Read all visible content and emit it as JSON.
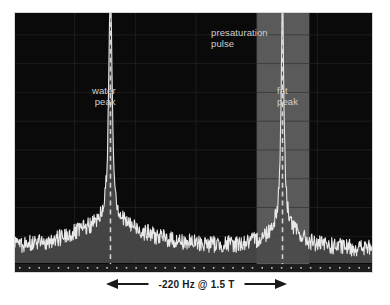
{
  "figure": {
    "background_color": "#ffffff",
    "plot_background_color": "#0a0a0a",
    "trace_color": "#e8e8e8",
    "fill_color": "#4a4a4a",
    "grid_color": "#2b2b2b",
    "band_color": "#5a5a5a",
    "marker_color": "#dcdcdc"
  },
  "annotations": {
    "presaturation_label": "presaturation\npulse",
    "water_label": "water\npeak",
    "fat_label": "fat\npeak",
    "axis_label": "-220 Hz @ 1.5 T"
  },
  "chart_data": {
    "type": "line",
    "title": "",
    "xlabel": "-220 Hz @ 1.5 T",
    "ylabel": "",
    "grid": true,
    "legend": null,
    "xlim": [
      0,
      359
    ],
    "ylim": [
      0,
      1
    ],
    "x_grid_positions": [
      60,
      121,
      182,
      243,
      304
    ],
    "y_grid_positions": [
      22,
      51,
      80,
      109,
      138,
      167,
      196,
      225
    ],
    "axis_ticks_count": 37,
    "peaks": [
      {
        "name": "water peak",
        "x": 96,
        "height": 1.0,
        "width": 2.0,
        "base_width": 44,
        "marker": "dashed-vertical-line",
        "label": "water\npeak"
      },
      {
        "name": "fat peak",
        "x": 269,
        "height": 0.93,
        "width": 1.6,
        "base_width": 16,
        "marker": "dashed-vertical-line",
        "label": "fat\npeak"
      }
    ],
    "bands": [
      {
        "name": "presaturation pulse",
        "x_start": 243,
        "x_end": 296,
        "color": "#5a5a5a",
        "label": "presaturation\npulse"
      }
    ],
    "noise_floor": 0.055,
    "noise_amplitude": 0.035,
    "measurement": {
      "separation_value": -220,
      "separation_unit": "Hz",
      "field_strength": "1.5 T",
      "arrow_from_x": 96,
      "arrow_to_x": 269
    }
  }
}
